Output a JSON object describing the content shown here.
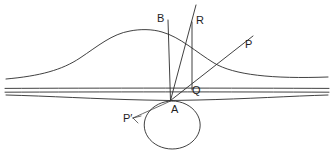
{
  "figure": {
    "background_color": "#ffffff",
    "stroke_color": "#2b2b2b",
    "width": 334,
    "height": 153
  },
  "labels": [
    {
      "id": "B",
      "text": "B",
      "x": 157,
      "y": 13
    },
    {
      "id": "R",
      "text": "R",
      "x": 196,
      "y": 15
    },
    {
      "id": "P",
      "text": "P",
      "x": 245,
      "y": 39
    },
    {
      "id": "Q",
      "text": "Q",
      "x": 192,
      "y": 85
    },
    {
      "id": "A",
      "text": "A",
      "x": 171,
      "y": 104
    },
    {
      "id": "Pprime",
      "text": "P′",
      "x": 123,
      "y": 113
    }
  ],
  "geometry": {
    "apex": {
      "name": "A",
      "x": 170.5,
      "y": 100.5
    },
    "point_B": {
      "x": 168,
      "y": 20
    },
    "point_R": {
      "x": 192,
      "y": 22
    },
    "point_P": {
      "x": 239,
      "y": 45
    },
    "point_Q": {
      "x": 192,
      "y": 90
    },
    "baseline_upper_y": 88,
    "baseline_lower_y": 92,
    "circle": {
      "cx": 172,
      "cy": 125,
      "rx": 28,
      "ry": 24
    },
    "bell_peak": {
      "x": 147,
      "y": 30
    },
    "bell_tail_left_y": 78,
    "bell_tail_right_y": 78
  },
  "paths": {
    "bell_curve": "M 6,79 C 40,76 62,70 80,58 C 98,46 112,34 130,31 C 140,29 152,29 162,32 C 180,37 196,52 214,63 C 234,75 272,79 328,77",
    "lower_curve": "M 6,95 C 48,96 96,99 144,100 L 170.5,100.5 L 198,100 C 246,99 292,96 328,95",
    "baseline_upper": "M 5,88.4 C 90,88.0 240,88.0 329,88.4",
    "baseline_lower": "M 5,92.2 C 90,91.8 240,91.8 329,92.2",
    "ray_B_to_A": "M 168,20 L 170.5,100.5",
    "ray_R_through_A": "M 196,5 L 170.5,100.5",
    "ray_R_to_Q": "M 192,22 L 192,90",
    "ray_A_to_P": "M 170.5,100.5 L 253,36",
    "circle_tangent": "M 172,101 A 28,24 0 1 0 172.4,101",
    "arc_to_Pprime": "M 170.5,101 C 160,106 146,112 133,118",
    "arrow_Pprime": "M 133,118 L 141,116 M 133,118 L 138,123"
  }
}
